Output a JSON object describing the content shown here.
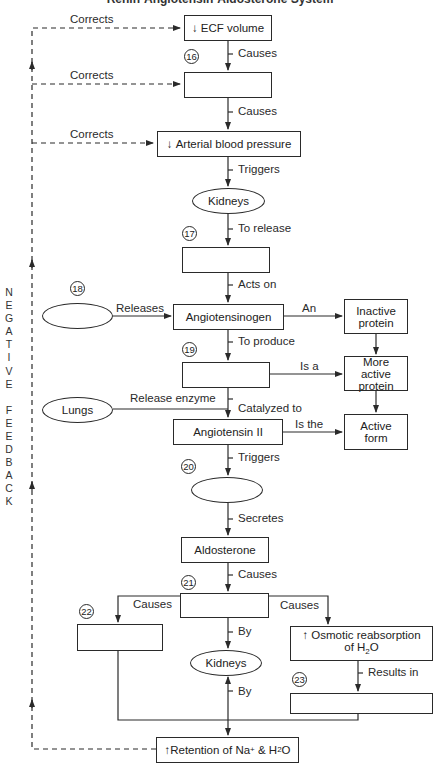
{
  "title": "Renin-Angiotensin-Aldosterone System",
  "side_label": "NEGATIVE FEEDBACK",
  "side_letters": [
    "N",
    "E",
    "G",
    "A",
    "T",
    "I",
    "V",
    "E",
    "",
    "F",
    "E",
    "E",
    "D",
    "B",
    "A",
    "C",
    "K"
  ],
  "nodes": {
    "ecf": {
      "arrow": "↓",
      "text": "ECF volume"
    },
    "box16": {
      "number": "16",
      "text": ""
    },
    "arterial": {
      "arrow": "↓",
      "text": "Arterial blood pressure"
    },
    "kidneys1": {
      "text": "Kidneys"
    },
    "box17": {
      "number": "17",
      "text": ""
    },
    "ellipse18": {
      "number": "18",
      "text": ""
    },
    "angiotensinogen": {
      "text": "Angiotensinogen"
    },
    "inactive": {
      "text": "Inactive protein"
    },
    "box19": {
      "number": "19",
      "text": ""
    },
    "more_active": {
      "text": "More active protein"
    },
    "lungs": {
      "text": "Lungs"
    },
    "angiotensin2": {
      "text": "Angiotensin II"
    },
    "active_form": {
      "text": "Active form"
    },
    "ellipse20": {
      "number": "20",
      "text": ""
    },
    "aldosterone": {
      "text": "Aldosterone"
    },
    "box21": {
      "number": "21",
      "text": ""
    },
    "box22": {
      "number": "22",
      "text": ""
    },
    "osmotic": {
      "arrow": "↑",
      "text": "Osmotic reabsorption",
      "text2": "of H",
      "sub": "2",
      "text3": "O"
    },
    "kidneys2": {
      "text": "Kidneys"
    },
    "box23": {
      "number": "23",
      "text": ""
    },
    "retention": {
      "arrow": "↑",
      "text": "Retention of Na",
      "sup": "+",
      "text2": " & H",
      "sub": "2",
      "text3": "O"
    }
  },
  "edges": {
    "corrects1": "Corrects",
    "corrects2": "Corrects",
    "corrects3": "Corrects",
    "causes1": "Causes",
    "causes2": "Causes",
    "triggers1": "Triggers",
    "to_release": "To release",
    "acts_on": "Acts on",
    "releases": "Releases",
    "an": "An",
    "to_produce": "To produce",
    "is_a": "Is a",
    "release_enzyme": "Release enzyme",
    "catalyzed_to": "Catalyzed to",
    "is_the": "Is the",
    "triggers2": "Triggers",
    "secretes": "Secretes",
    "causes3": "Causes",
    "causes_left": "Causes",
    "causes_right": "Causes",
    "by1": "By",
    "by2": "By",
    "results_in": "Results in"
  }
}
